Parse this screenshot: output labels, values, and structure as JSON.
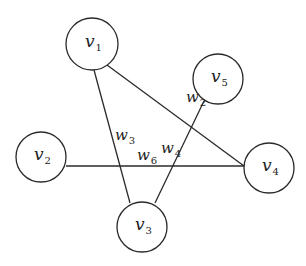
{
  "diagram": {
    "type": "graph",
    "nodes": [
      {
        "id": "v1",
        "label": "v",
        "sub": "1",
        "cx": 92,
        "cy": 44,
        "r": 26
      },
      {
        "id": "v2",
        "label": "v",
        "sub": "2",
        "cx": 41,
        "cy": 157,
        "r": 25
      },
      {
        "id": "v3",
        "label": "v",
        "sub": "3",
        "cx": 142,
        "cy": 227,
        "r": 25
      },
      {
        "id": "v4",
        "label": "v",
        "sub": "4",
        "cx": 269,
        "cy": 168,
        "r": 25
      },
      {
        "id": "v5",
        "label": "v",
        "sub": "5",
        "cx": 218,
        "cy": 79,
        "r": 25
      }
    ],
    "edges": [
      {
        "id": "w2",
        "from": "v1",
        "to": "v4",
        "label": "w",
        "sub": "2",
        "x1": 107,
        "y1": 65,
        "x2": 244,
        "y2": 166,
        "lx": 186,
        "ly": 102
      },
      {
        "id": "w3",
        "from": "v1",
        "to": "v3",
        "label": "w",
        "sub": "3",
        "x1": 94,
        "y1": 70,
        "x2": 130,
        "y2": 203,
        "lx": 115,
        "ly": 140
      },
      {
        "id": "w4",
        "from": "v5",
        "to": "v3",
        "label": "w",
        "sub": "4",
        "x1": 204,
        "y1": 101,
        "x2": 155,
        "y2": 203,
        "lx": 161,
        "ly": 153
      },
      {
        "id": "w6",
        "from": "v2",
        "to": "v4",
        "label": "w",
        "sub": "6",
        "x1": 66,
        "y1": 166,
        "x2": 244,
        "y2": 166,
        "lx": 137,
        "ly": 160
      }
    ]
  }
}
